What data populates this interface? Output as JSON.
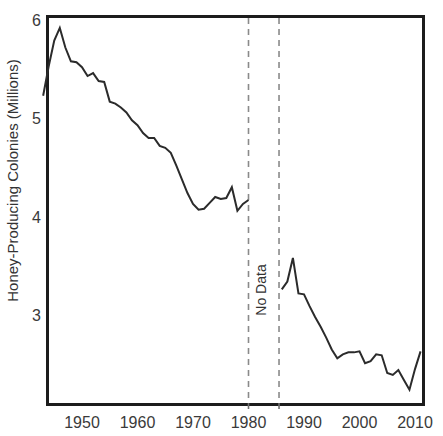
{
  "chart_data": {
    "type": "line",
    "title": "",
    "subtitle": "",
    "xlabel": "",
    "ylabel": "Honey-Producing Colonies (Millions)",
    "xlim": [
      1943,
      2011
    ],
    "ylim": [
      2.15,
      6.05
    ],
    "xticks": [
      1950,
      1960,
      1970,
      1980,
      1990,
      2000,
      2010
    ],
    "yticks": [
      3,
      4,
      5,
      6
    ],
    "grid": false,
    "legend": null,
    "line_color": "#2b2b2b",
    "line_width": 2,
    "annotations": [
      {
        "label": "No Data",
        "orientation": "vertical",
        "x_start": 1980,
        "x_end": 1985.5,
        "boundary_style": "dashed",
        "boundary_color": "#8a8a8a"
      }
    ],
    "series": [
      {
        "name": "Honey-Producing Colonies",
        "x": [
          1943,
          1944,
          1945,
          1946,
          1947,
          1948,
          1949,
          1950,
          1951,
          1952,
          1953,
          1954,
          1955,
          1956,
          1957,
          1958,
          1959,
          1960,
          1961,
          1962,
          1963,
          1964,
          1965,
          1966,
          1967,
          1968,
          1969,
          1970,
          1971,
          1972,
          1973,
          1974,
          1975,
          1976,
          1977,
          1978,
          1979,
          1980
        ],
        "y": [
          5.23,
          5.53,
          5.79,
          5.92,
          5.72,
          5.58,
          5.57,
          5.52,
          5.43,
          5.46,
          5.38,
          5.37,
          5.17,
          5.15,
          5.11,
          5.06,
          4.98,
          4.93,
          4.85,
          4.8,
          4.8,
          4.72,
          4.7,
          4.65,
          4.52,
          4.38,
          4.24,
          4.13,
          4.07,
          4.08,
          4.14,
          4.2,
          4.18,
          4.19,
          4.3,
          4.06,
          4.13,
          4.17
        ]
      },
      {
        "name": "Honey-Producing Colonies (post-gap)",
        "x": [
          1986,
          1987,
          1988,
          1989,
          1990,
          1991,
          1992,
          1993,
          1994,
          1995,
          1996,
          1997,
          1998,
          1999,
          2000,
          2001,
          2002,
          2003,
          2004,
          2005,
          2006,
          2007,
          2008,
          2009,
          2010,
          2011
        ],
        "y": [
          3.26,
          3.34,
          3.58,
          3.22,
          3.21,
          3.09,
          2.98,
          2.88,
          2.77,
          2.65,
          2.56,
          2.6,
          2.62,
          2.62,
          2.63,
          2.51,
          2.53,
          2.6,
          2.59,
          2.41,
          2.39,
          2.44,
          2.34,
          2.24,
          2.45,
          2.63
        ]
      }
    ],
    "data_points_note": "Annual honey-producing bee colonies in millions; data gap between 1980 and 1986."
  },
  "axis": {
    "ytick_labels": [
      "6",
      "5",
      "4",
      "3"
    ],
    "xtick_labels": [
      "1950",
      "1960",
      "1970",
      "1980",
      "1990",
      "2000",
      "2010"
    ],
    "y_axis_title": "Honey-Producing Colonies (Millions)"
  },
  "annotation": {
    "no_data_label": "No Data"
  },
  "colors": {
    "line": "#2b2b2b",
    "frame": "#1c1c1c",
    "dashed": "#8a8a8a",
    "text": "#3a3a3a",
    "background": "#ffffff"
  }
}
